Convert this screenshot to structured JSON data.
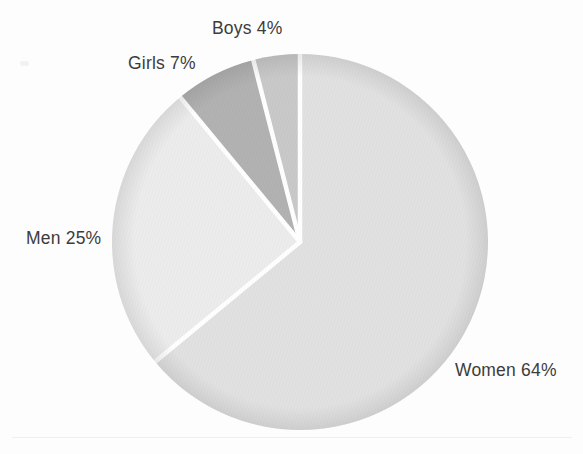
{
  "chart_data": {
    "type": "pie",
    "title": "",
    "subtitle": "",
    "xlabel": "",
    "ylabel": "",
    "legend_position": "none",
    "grid": false,
    "start_angle_deg": 0,
    "direction": "clockwise",
    "units": "percent",
    "categories": [
      "Women",
      "Men",
      "Girls",
      "Boys"
    ],
    "values": [
      64,
      25,
      7,
      4
    ],
    "labels": [
      "Women 64%",
      "Men 25%",
      "Girls 7%",
      "Boys 4%"
    ],
    "slice_colors": [
      "#e1e1e1",
      "#ececec",
      "#b2b2b2",
      "#c9c9c9"
    ],
    "slices": [
      {
        "name": "Women",
        "value": 64,
        "label": "Women 64%",
        "color": "#e1e1e1",
        "rim_color": "#d3d3d3"
      },
      {
        "name": "Men",
        "value": 25,
        "label": "Men 25%",
        "color": "#ececec",
        "rim_color": "#dedede"
      },
      {
        "name": "Girls",
        "value": 7,
        "label": "Girls 7%",
        "color": "#b2b2b2",
        "rim_color": "#a2a2a2"
      },
      {
        "name": "Boys",
        "value": 4,
        "label": "Boys 4%",
        "color": "#c9c9c9",
        "rim_color": "#bbbbbb"
      }
    ]
  },
  "chart": {
    "background_color": "#fdfdfd",
    "separator_color": "#ffffff",
    "label_color": "#3c3c3c",
    "center_x": 300,
    "center_y": 242,
    "radius": 188
  },
  "labels": {
    "women": "Women 64%",
    "men": "Men 25%",
    "girls": "Girls 7%",
    "boys": "Boys 4%"
  }
}
